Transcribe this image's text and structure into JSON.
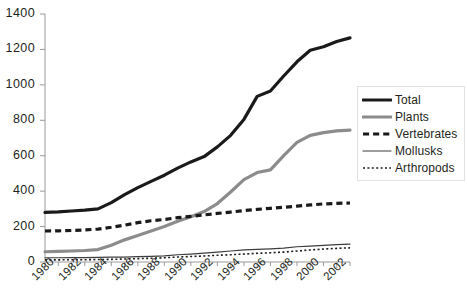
{
  "chart_data": {
    "type": "line",
    "title": "",
    "subtitle": "",
    "xlabel": "",
    "ylabel": "",
    "xlim": [
      1980,
      2003
    ],
    "ylim": [
      0,
      1400
    ],
    "grid": false,
    "legend_position": "right",
    "x": [
      1980,
      1981,
      1982,
      1983,
      1984,
      1985,
      1986,
      1987,
      1988,
      1989,
      1990,
      1991,
      1992,
      1993,
      1994,
      1995,
      1996,
      1997,
      1998,
      1999,
      2000,
      2001,
      2002,
      2003
    ],
    "x_tick_labels": [
      "1980",
      "1982",
      "1984",
      "1986",
      "1988",
      "1990",
      "1992",
      "1994",
      "1996",
      "1998",
      "2000",
      "2002"
    ],
    "x_tick_values": [
      1980,
      1982,
      1984,
      1986,
      1988,
      1990,
      1992,
      1994,
      1996,
      1998,
      2000,
      2002
    ],
    "y_tick_labels": [
      "0",
      "200",
      "400",
      "600",
      "800",
      "1000",
      "1200",
      "1400"
    ],
    "y_tick_values": [
      0,
      200,
      400,
      600,
      800,
      1000,
      1200,
      1400
    ],
    "series": [
      {
        "name": "Total",
        "color": "#1a1a1a",
        "style": "solid",
        "width": 3.2,
        "values": [
          280,
          283,
          288,
          293,
          300,
          335,
          380,
          420,
          455,
          490,
          530,
          565,
          595,
          650,
          715,
          805,
          935,
          965,
          1050,
          1130,
          1195,
          1215,
          1245,
          1265
        ]
      },
      {
        "name": "Plants",
        "color": "#8c8c8c",
        "style": "solid",
        "width": 3.2,
        "values": [
          58,
          60,
          62,
          65,
          70,
          95,
          125,
          150,
          175,
          200,
          230,
          255,
          285,
          330,
          395,
          465,
          505,
          520,
          600,
          675,
          715,
          730,
          740,
          745
        ]
      },
      {
        "name": "Vertebrates",
        "color": "#1a1a1a",
        "style": "dashed",
        "width": 3.2,
        "values": [
          175,
          176,
          178,
          181,
          186,
          196,
          208,
          222,
          233,
          240,
          250,
          258,
          266,
          274,
          282,
          290,
          297,
          303,
          309,
          315,
          322,
          328,
          331,
          333
        ]
      },
      {
        "name": "Mollusks",
        "color": "#3d3d3d",
        "style": "solid",
        "width": 1.2,
        "values": [
          24,
          24,
          25,
          25,
          26,
          27,
          28,
          30,
          32,
          35,
          41,
          45,
          50,
          56,
          62,
          68,
          71,
          74,
          78,
          86,
          90,
          94,
          98,
          101
        ]
      },
      {
        "name": "Arthropods",
        "color": "#1a1a1a",
        "style": "dotted",
        "width": 1.6,
        "values": [
          12,
          12,
          13,
          13,
          14,
          15,
          17,
          19,
          21,
          24,
          28,
          31,
          34,
          38,
          41,
          45,
          49,
          52,
          56,
          62,
          68,
          73,
          77,
          80
        ]
      }
    ]
  },
  "legend": {
    "items": [
      {
        "label": "Total"
      },
      {
        "label": "Plants"
      },
      {
        "label": "Vertebrates"
      },
      {
        "label": "Mollusks"
      },
      {
        "label": "Arthropods"
      }
    ]
  }
}
